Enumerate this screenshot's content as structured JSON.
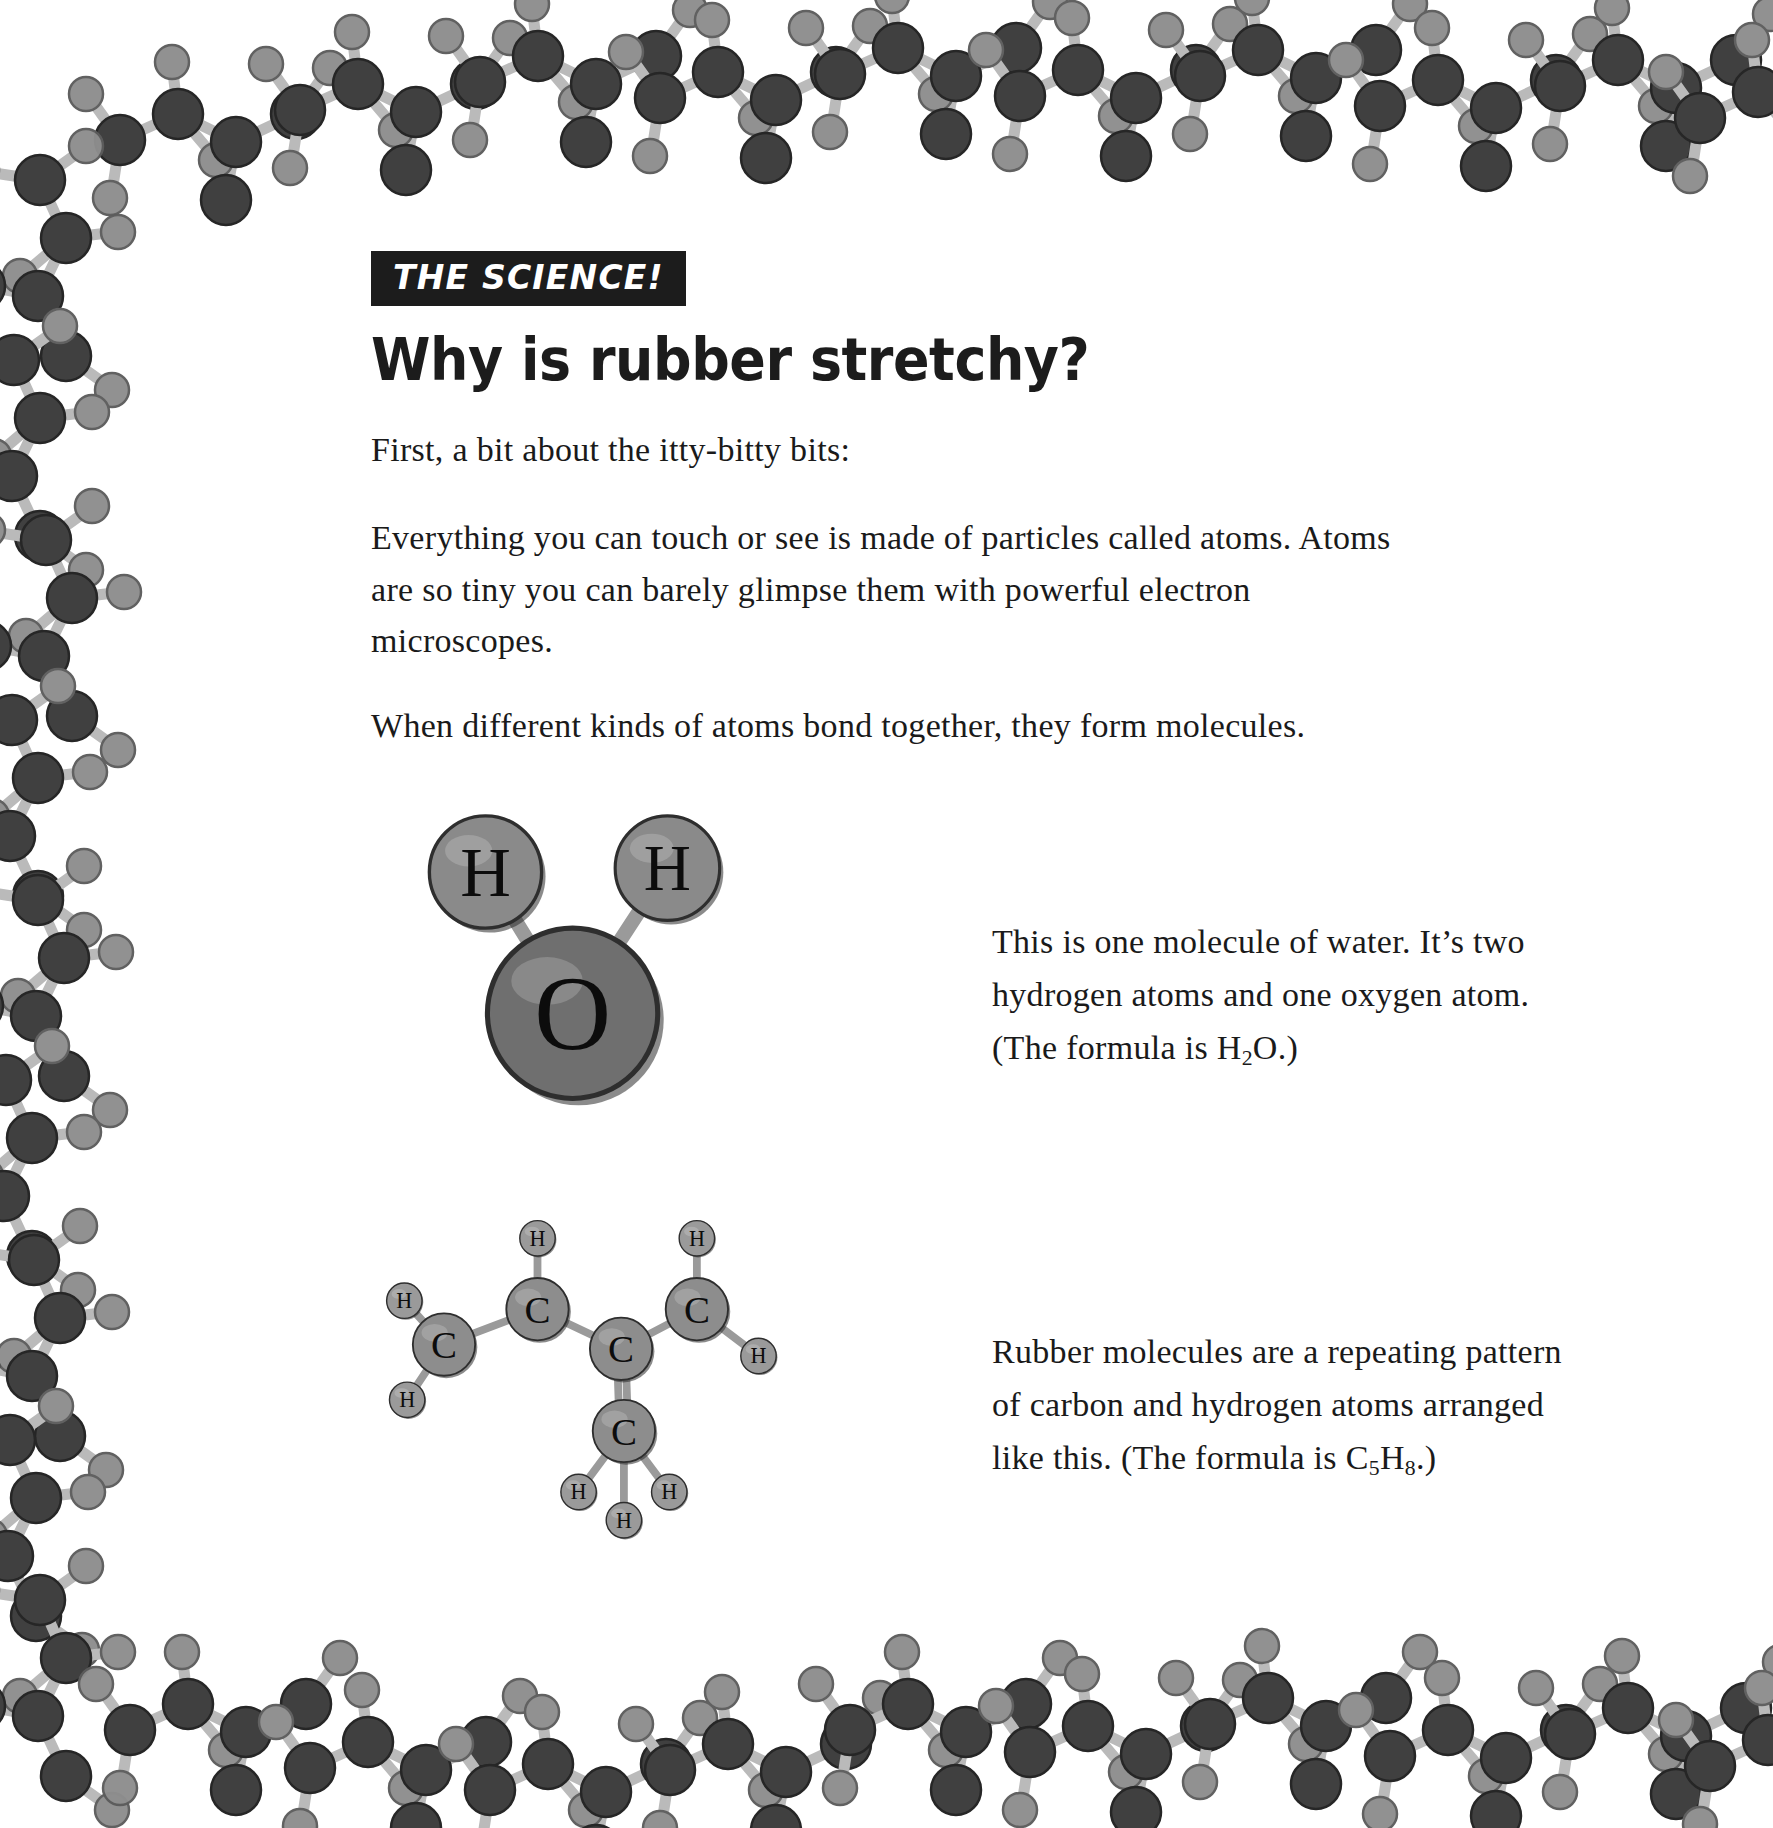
{
  "page": {
    "background": "#ffffff",
    "text_color": "#1a1a1a"
  },
  "header": {
    "kicker": "THE SCIENCE!",
    "kicker_bg": "#1c1c1c",
    "kicker_fg": "#ffffff",
    "title": "Why is rubber stretchy?"
  },
  "body": {
    "paragraphs": [
      "First, a bit about the itty-bitty bits:",
      "Everything you can touch or see is made of particles called atoms. Atoms are so tiny you can barely glimpse them with powerful electron microscopes.",
      "When different kinds of atoms bond together, they form molecules."
    ]
  },
  "captions": {
    "water": {
      "line1": "This is one molecule of water. It’s two",
      "line2": "hydrogen atoms and one oxygen atom.",
      "line3_pre": "(The formula is H",
      "line3_sub": "2",
      "line3_post": "O.)"
    },
    "rubber": {
      "line1": "Rubber molecules are a repeating pattern",
      "line2": "of carbon and hydrogen atoms arranged",
      "line3_pre": "like this. (The formula is C",
      "line3_sub1": "5",
      "line3_mid": "H",
      "line3_sub2": "8",
      "line3_post": ".)"
    }
  },
  "diagrams": {
    "water": {
      "name": "water-molecule",
      "formula": "H2O",
      "atoms": [
        {
          "label": "H",
          "element": "hydrogen",
          "cx": 62,
          "cy": 62,
          "r": 58,
          "fill": "#8a8a8a"
        },
        {
          "label": "H",
          "element": "hydrogen",
          "cx": 250,
          "cy": 58,
          "r": 54,
          "fill": "#8a8a8a"
        },
        {
          "label": "O",
          "element": "oxygen",
          "cx": 152,
          "cy": 208,
          "r": 88,
          "fill": "#6f6f6f"
        }
      ],
      "bonds": [
        {
          "from": 0,
          "to": 2
        },
        {
          "from": 1,
          "to": 2
        }
      ]
    },
    "rubber": {
      "name": "isoprene-unit",
      "formula": "C5H8",
      "atoms": [
        {
          "label": "C",
          "element": "carbon",
          "cx": 68,
          "cy": 190,
          "r": 44,
          "fill": "#8d8d8d"
        },
        {
          "label": "C",
          "element": "carbon",
          "cx": 200,
          "cy": 140,
          "r": 44,
          "fill": "#8d8d8d"
        },
        {
          "label": "C",
          "element": "carbon",
          "cx": 318,
          "cy": 196,
          "r": 44,
          "fill": "#8d8d8d"
        },
        {
          "label": "C",
          "element": "carbon",
          "cx": 425,
          "cy": 140,
          "r": 44,
          "fill": "#8d8d8d"
        },
        {
          "label": "C",
          "element": "carbon",
          "cx": 322,
          "cy": 312,
          "r": 44,
          "fill": "#8d8d8d"
        },
        {
          "label": "H",
          "element": "hydrogen",
          "cx": 200,
          "cy": 40,
          "r": 25,
          "fill": "#9a9a9a"
        },
        {
          "label": "H",
          "element": "hydrogen",
          "cx": 425,
          "cy": 40,
          "r": 25,
          "fill": "#9a9a9a"
        },
        {
          "label": "H",
          "element": "hydrogen",
          "cx": 12,
          "cy": 128,
          "r": 25,
          "fill": "#9a9a9a"
        },
        {
          "label": "H",
          "element": "hydrogen",
          "cx": 16,
          "cy": 268,
          "r": 25,
          "fill": "#9a9a9a"
        },
        {
          "label": "H",
          "element": "hydrogen",
          "cx": 512,
          "cy": 206,
          "r": 25,
          "fill": "#9a9a9a"
        },
        {
          "label": "H",
          "element": "hydrogen",
          "cx": 258,
          "cy": 398,
          "r": 25,
          "fill": "#9a9a9a"
        },
        {
          "label": "H",
          "element": "hydrogen",
          "cx": 386,
          "cy": 398,
          "r": 25,
          "fill": "#9a9a9a"
        },
        {
          "label": "H",
          "element": "hydrogen",
          "cx": 322,
          "cy": 438,
          "r": 25,
          "fill": "#9a9a9a"
        }
      ],
      "bonds": [
        {
          "from": 0,
          "to": 1,
          "order": 1
        },
        {
          "from": 1,
          "to": 2,
          "order": 1
        },
        {
          "from": 2,
          "to": 3,
          "order": 1
        },
        {
          "from": 2,
          "to": 4,
          "order": 2
        },
        {
          "from": 1,
          "to": 5,
          "order": 1
        },
        {
          "from": 3,
          "to": 6,
          "order": 1
        },
        {
          "from": 0,
          "to": 7,
          "order": 1
        },
        {
          "from": 0,
          "to": 8,
          "order": 1
        },
        {
          "from": 3,
          "to": 9,
          "order": 1
        },
        {
          "from": 4,
          "to": 10,
          "order": 1
        },
        {
          "from": 4,
          "to": 11,
          "order": 1
        },
        {
          "from": 4,
          "to": 12,
          "order": 1
        }
      ]
    }
  },
  "border_decoration": {
    "name": "polymer-chain-border",
    "description": "repeating carbon-hydrogen polymer chain illustration framing the page",
    "carbon_color": "#3a3a3a",
    "hydrogen_color": "#8e8e8e",
    "bond_color": "#b8b8b8"
  }
}
